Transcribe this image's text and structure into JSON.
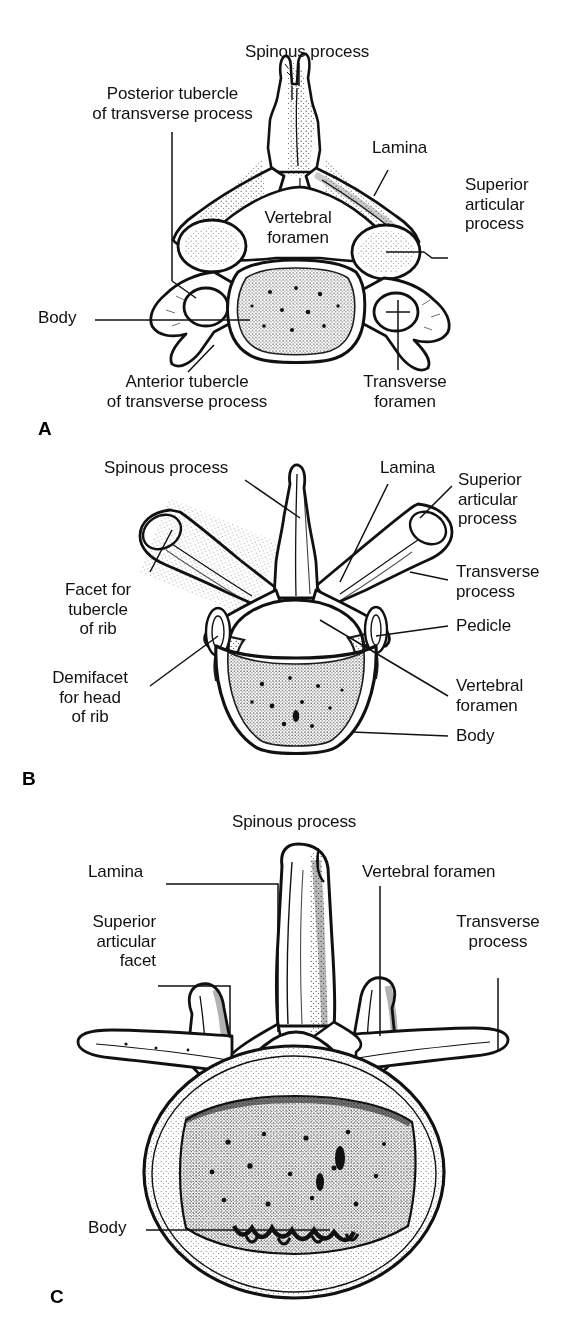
{
  "figure": {
    "background_color": "#ffffff",
    "ink_color": "#111111",
    "panel_count": 3
  },
  "panels": [
    {
      "letter": "A",
      "name": "cervical-vertebra",
      "description": "Cervical vertebra, superior view",
      "labels": [
        {
          "id": "spinous-process",
          "text": "Spinous process"
        },
        {
          "id": "posterior-tubercle",
          "text": "Posterior tubercle\nof transverse process"
        },
        {
          "id": "lamina",
          "text": "Lamina"
        },
        {
          "id": "superior-articular",
          "text": "Superior\narticular\nprocess"
        },
        {
          "id": "vertebral-foramen",
          "text": "Vertebral\nforamen"
        },
        {
          "id": "body",
          "text": "Body"
        },
        {
          "id": "anterior-tubercle",
          "text": "Anterior tubercle\nof transverse process"
        },
        {
          "id": "transverse-foramen",
          "text": "Transverse\nforamen"
        }
      ]
    },
    {
      "letter": "B",
      "name": "thoracic-vertebra",
      "description": "Thoracic vertebra, superior view",
      "labels": [
        {
          "id": "spinous-process",
          "text": "Spinous process"
        },
        {
          "id": "lamina",
          "text": "Lamina"
        },
        {
          "id": "superior-articular",
          "text": "Superior\narticular\nprocess"
        },
        {
          "id": "transverse-process",
          "text": "Transverse\nprocess"
        },
        {
          "id": "facet-tubercle-rib",
          "text": "Facet for\ntubercle\nof rib"
        },
        {
          "id": "pedicle",
          "text": "Pedicle"
        },
        {
          "id": "demifacet-head-rib",
          "text": "Demifacet\nfor head\nof rib"
        },
        {
          "id": "vertebral-foramen",
          "text": "Vertebral\nforamen"
        },
        {
          "id": "body",
          "text": "Body"
        }
      ]
    },
    {
      "letter": "C",
      "name": "lumbar-vertebra",
      "description": "Lumbar vertebra, superior view",
      "labels": [
        {
          "id": "spinous-process",
          "text": "Spinous process"
        },
        {
          "id": "lamina",
          "text": "Lamina"
        },
        {
          "id": "vertebral-foramen",
          "text": "Vertebral foramen"
        },
        {
          "id": "superior-articular-facet",
          "text": "Superior\narticular\nfacet"
        },
        {
          "id": "transverse-process",
          "text": "Transverse\nprocess"
        },
        {
          "id": "body",
          "text": "Body"
        }
      ]
    }
  ]
}
